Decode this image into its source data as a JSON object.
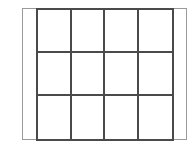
{
  "diagram": {
    "type": "grid",
    "rows": 3,
    "columns": 4,
    "cells": [
      [
        "",
        "",
        "",
        ""
      ],
      [
        "",
        "",
        "",
        ""
      ],
      [
        "",
        "",
        "",
        ""
      ]
    ],
    "colors": {
      "grid_line": "#4a4a4a",
      "frame_line": "#9a9a9a",
      "background": "#ffffff"
    }
  }
}
